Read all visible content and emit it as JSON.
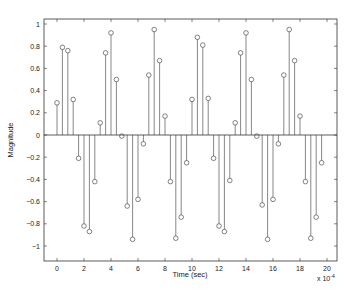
{
  "chart_data": {
    "type": "stem",
    "title": "",
    "xlabel": "Time (sec)",
    "ylabel": "Magnitude",
    "x_scale_note": "x 10^-4",
    "xlim": [
      -1.2,
      20.5
    ],
    "ylim": [
      -1.15,
      1.03
    ],
    "xticks": [
      0,
      2,
      4,
      6,
      8,
      10,
      12,
      14,
      16,
      18,
      20
    ],
    "yticks": [
      -1,
      -0.8,
      -0.6,
      -0.4,
      -0.2,
      0,
      0.2,
      0.4,
      0.6,
      0.8,
      1
    ],
    "grid": false,
    "sample_interval": 0.4,
    "x": [
      0,
      0.4,
      0.8,
      1.2,
      1.6,
      2.0,
      2.4,
      2.8,
      3.2,
      3.6,
      4.0,
      4.4,
      4.8,
      5.2,
      5.6,
      6.0,
      6.4,
      6.8,
      7.2,
      7.6,
      8.0,
      8.4,
      8.8,
      9.2,
      9.6,
      10.0,
      10.4,
      10.8,
      11.2,
      11.6,
      12.0,
      12.4,
      12.8,
      13.2,
      13.6,
      14.0,
      14.4,
      14.8,
      15.2,
      15.6,
      16.0,
      16.4,
      16.8,
      17.2,
      17.6,
      18.0,
      18.4,
      18.8,
      19.2,
      19.6
    ],
    "values": [
      0.29,
      0.79,
      0.76,
      0.32,
      -0.21,
      -0.82,
      -0.87,
      -0.42,
      0.11,
      0.74,
      0.92,
      0.5,
      -0.01,
      -0.64,
      -0.94,
      -0.58,
      -0.08,
      0.54,
      0.95,
      0.67,
      0.17,
      -0.42,
      -0.93,
      -0.74,
      -0.25,
      0.32,
      0.88,
      0.81,
      0.33,
      -0.21,
      -0.82,
      -0.87,
      -0.41,
      0.11,
      0.74,
      0.92,
      0.5,
      -0.01,
      -0.63,
      -0.94,
      -0.58,
      -0.08,
      0.54,
      0.95,
      0.67,
      0.17,
      -0.42,
      -0.93,
      -0.74,
      -0.25
    ],
    "colors": {
      "stem": "#555555",
      "marker": "#333333",
      "axes": "#333333",
      "baseline": "#333333"
    }
  },
  "labels": {
    "xlabel": "Time (sec)",
    "ylabel": "Magnitude",
    "exponent_prefix": "x 10",
    "exponent": "-4"
  }
}
